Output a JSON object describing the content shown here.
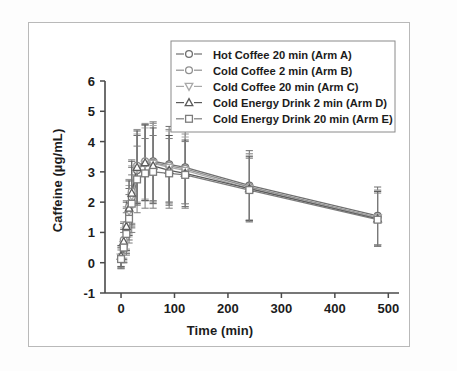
{
  "chart_data": {
    "type": "line",
    "title": "",
    "xlabel": "Time (min)",
    "ylabel": "Caffeine (µg/mL)",
    "xlim": [
      -30,
      520
    ],
    "ylim": [
      -1,
      6
    ],
    "xticks": [
      0,
      100,
      200,
      300,
      400,
      500
    ],
    "xticklabels": [
      "0",
      "100",
      "200",
      "300",
      "400",
      "500"
    ],
    "yticks": [
      -1,
      0,
      1,
      2,
      3,
      4,
      5,
      6
    ],
    "yticklabels": [
      "-1",
      "0",
      "1",
      "2",
      "3",
      "4",
      "5",
      "6"
    ],
    "grid": false,
    "legend_position": "upper right",
    "errorbars": "standard deviation",
    "x": [
      0,
      5,
      10,
      15,
      20,
      30,
      45,
      60,
      90,
      120,
      240,
      480
    ],
    "series": [
      {
        "name": "Hot Coffee 20 min (Arm A)",
        "marker": "circle-open",
        "color": "#6f6f6f",
        "values": [
          0.15,
          0.55,
          1.05,
          1.6,
          2.15,
          3.05,
          3.3,
          3.35,
          3.25,
          3.15,
          2.55,
          1.55
        ],
        "errors": [
          0.35,
          0.55,
          0.75,
          0.85,
          1.0,
          1.15,
          1.25,
          1.3,
          1.25,
          1.2,
          1.15,
          0.95
        ]
      },
      {
        "name": "Cold Coffee 2 min (Arm B)",
        "marker": "circle-open",
        "color": "#909090",
        "values": [
          0.2,
          0.75,
          1.25,
          1.85,
          2.35,
          3.2,
          3.35,
          3.3,
          3.2,
          3.1,
          2.5,
          1.5
        ],
        "errors": [
          0.35,
          0.6,
          0.8,
          0.9,
          1.05,
          1.2,
          1.25,
          1.3,
          1.2,
          1.15,
          1.1,
          0.9
        ]
      },
      {
        "name": "Cold Coffee 20 min (Arm C)",
        "marker": "triangle-down-open",
        "color": "#a8a8a8",
        "values": [
          0.18,
          0.6,
          1.1,
          1.7,
          2.2,
          3.1,
          3.25,
          3.28,
          3.15,
          3.05,
          2.45,
          1.48
        ],
        "errors": [
          0.3,
          0.55,
          0.75,
          0.85,
          1.0,
          1.15,
          1.2,
          1.25,
          1.2,
          1.1,
          1.1,
          0.9
        ]
      },
      {
        "name": "Cold Energy Drink 2 min (Arm D)",
        "marker": "triangle-up-open",
        "color": "#5a5a5a",
        "values": [
          0.22,
          0.7,
          1.2,
          1.8,
          2.3,
          3.15,
          3.3,
          3.2,
          3.05,
          2.95,
          2.45,
          1.45
        ],
        "errors": [
          0.35,
          0.6,
          0.8,
          0.9,
          1.05,
          1.2,
          1.25,
          1.25,
          1.15,
          1.1,
          1.05,
          0.9
        ]
      },
      {
        "name": "Cold Energy Drink 20 min (Arm E)",
        "marker": "square-open",
        "color": "#7c7c7c",
        "values": [
          0.12,
          0.5,
          0.95,
          1.45,
          1.95,
          2.75,
          2.95,
          3.0,
          2.95,
          2.9,
          2.4,
          1.42
        ],
        "errors": [
          0.3,
          0.5,
          0.7,
          0.8,
          0.95,
          1.1,
          1.15,
          1.2,
          1.15,
          1.1,
          1.05,
          0.88
        ]
      }
    ]
  },
  "legend": {
    "items": [
      {
        "label": "Hot Coffee 20 min (Arm A)"
      },
      {
        "label": "Cold Coffee 2 min (Arm B)"
      },
      {
        "label": "Cold Coffee 20 min (Arm C)"
      },
      {
        "label": "Cold Energy Drink 2 min (Arm D)"
      },
      {
        "label": "Cold Energy Drink 20 min (Arm E)"
      }
    ]
  },
  "axes": {
    "x_title": "Time (min)",
    "y_title": "Caffeine (µg/mL)"
  }
}
